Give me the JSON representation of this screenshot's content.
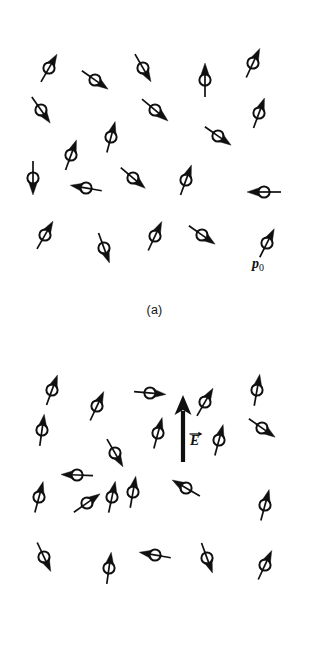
{
  "figure": {
    "background_color": "#ffffff",
    "ink_color": "#101010",
    "width": 309,
    "height": 671
  },
  "panels": [
    {
      "id": "a",
      "caption": "(a)",
      "description": "Randomly oriented permanent electric dipoles in the absence of an external electric field",
      "dipole_count": 24,
      "labels": [
        {
          "name": "dipole-moment-label",
          "symbol": "p",
          "subscript": "0",
          "x": 252,
          "y": 268
        }
      ],
      "dipoles": [
        {
          "x": 49,
          "y": 68,
          "angle": 300,
          "len": 32
        },
        {
          "x": 95,
          "y": 80,
          "angle": 35,
          "len": 32
        },
        {
          "x": 143,
          "y": 68,
          "angle": 60,
          "len": 32
        },
        {
          "x": 205,
          "y": 80,
          "angle": 270,
          "len": 34
        },
        {
          "x": 253,
          "y": 63,
          "angle": 295,
          "len": 32
        },
        {
          "x": 41,
          "y": 110,
          "angle": 55,
          "len": 32
        },
        {
          "x": 155,
          "y": 110,
          "angle": 40,
          "len": 34
        },
        {
          "x": 259,
          "y": 113,
          "angle": 290,
          "len": 32
        },
        {
          "x": 111,
          "y": 137,
          "angle": 285,
          "len": 32
        },
        {
          "x": 218,
          "y": 136,
          "angle": 35,
          "len": 32
        },
        {
          "x": 71,
          "y": 155,
          "angle": 290,
          "len": 32
        },
        {
          "x": 33,
          "y": 178,
          "angle": 90,
          "len": 34
        },
        {
          "x": 86,
          "y": 188,
          "angle": 190,
          "len": 32
        },
        {
          "x": 133,
          "y": 178,
          "angle": 40,
          "len": 32
        },
        {
          "x": 186,
          "y": 180,
          "angle": 290,
          "len": 32
        },
        {
          "x": 264,
          "y": 192,
          "angle": 180,
          "len": 34
        },
        {
          "x": 45,
          "y": 235,
          "angle": 300,
          "len": 32
        },
        {
          "x": 104,
          "y": 248,
          "angle": 70,
          "len": 32
        },
        {
          "x": 155,
          "y": 236,
          "angle": 295,
          "len": 32
        },
        {
          "x": 202,
          "y": 235,
          "angle": 35,
          "len": 32
        },
        {
          "x": 267,
          "y": 243,
          "angle": 297,
          "len": 32
        }
      ]
    },
    {
      "id": "b",
      "caption": "(b)",
      "description": "Dipoles partially aligned by an applied electric field pointing up",
      "dipole_count": 24,
      "field": {
        "name": "electric-field-arrow",
        "symbol": "E",
        "vector": true,
        "direction": "up",
        "x": 183,
        "y_tail": 122,
        "y_tip": 55,
        "label_x": 190,
        "label_y": 105
      },
      "dipoles": [
        {
          "x": 52,
          "y": 50,
          "angle": 290,
          "len": 32
        },
        {
          "x": 97,
          "y": 66,
          "angle": 295,
          "len": 32
        },
        {
          "x": 150,
          "y": 53,
          "angle": 5,
          "len": 32
        },
        {
          "x": 205,
          "y": 62,
          "angle": 300,
          "len": 32
        },
        {
          "x": 257,
          "y": 50,
          "angle": 280,
          "len": 32
        },
        {
          "x": 42,
          "y": 90,
          "angle": 278,
          "len": 32
        },
        {
          "x": 158,
          "y": 93,
          "angle": 285,
          "len": 32
        },
        {
          "x": 219,
          "y": 100,
          "angle": 285,
          "len": 32
        },
        {
          "x": 262,
          "y": 88,
          "angle": 35,
          "len": 32
        },
        {
          "x": 115,
          "y": 113,
          "angle": 60,
          "len": 32
        },
        {
          "x": 77,
          "y": 135,
          "angle": 182,
          "len": 32
        },
        {
          "x": 39,
          "y": 157,
          "angle": 285,
          "len": 32
        },
        {
          "x": 87,
          "y": 163,
          "angle": 325,
          "len": 32
        },
        {
          "x": 133,
          "y": 152,
          "angle": 280,
          "len": 32
        },
        {
          "x": 186,
          "y": 148,
          "angle": 210,
          "len": 32
        },
        {
          "x": 112,
          "y": 157,
          "angle": 282,
          "len": 32
        },
        {
          "x": 265,
          "y": 165,
          "angle": 285,
          "len": 32
        },
        {
          "x": 44,
          "y": 217,
          "angle": 65,
          "len": 32
        },
        {
          "x": 109,
          "y": 228,
          "angle": 278,
          "len": 32
        },
        {
          "x": 155,
          "y": 215,
          "angle": 190,
          "len": 32
        },
        {
          "x": 207,
          "y": 218,
          "angle": 70,
          "len": 32
        },
        {
          "x": 265,
          "y": 225,
          "angle": 295,
          "len": 32
        }
      ]
    }
  ]
}
